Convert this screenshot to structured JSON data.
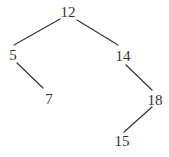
{
  "diagram": {
    "type": "binary-search-tree",
    "text_color": "#333333",
    "edge_color": "#3a3a3a",
    "background": "#ffffff",
    "nodes": [
      {
        "id": "n12",
        "label": "12",
        "x": 68,
        "y": 12
      },
      {
        "id": "n5",
        "label": "5",
        "x": 13,
        "y": 55
      },
      {
        "id": "n14",
        "label": "14",
        "x": 123,
        "y": 56
      },
      {
        "id": "n7",
        "label": "7",
        "x": 49,
        "y": 99
      },
      {
        "id": "n18",
        "label": "18",
        "x": 155,
        "y": 100
      },
      {
        "id": "n15",
        "label": "15",
        "x": 122,
        "y": 141
      }
    ],
    "edges": [
      {
        "from": "12",
        "to": "5",
        "x1": 60,
        "y1": 19,
        "x2": 14,
        "y2": 45
      },
      {
        "from": "12",
        "to": "14",
        "x1": 77,
        "y1": 20,
        "x2": 118,
        "y2": 45
      },
      {
        "from": "5",
        "to": "7",
        "x1": 17,
        "y1": 63,
        "x2": 43,
        "y2": 88
      },
      {
        "from": "14",
        "to": "18",
        "x1": 126,
        "y1": 65,
        "x2": 152,
        "y2": 90
      },
      {
        "from": "18",
        "to": "15",
        "x1": 152,
        "y1": 107,
        "x2": 124,
        "y2": 132
      }
    ]
  }
}
